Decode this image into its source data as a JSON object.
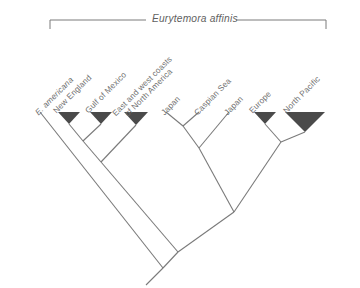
{
  "figure": {
    "type": "cladogram",
    "background_color": "#ffffff",
    "line_color": "#7a7a7a",
    "triangle_fill": "#4a4a4a",
    "text_color": "#6f6f6f",
    "clade_bracket": {
      "label": "Eurytemora affinis",
      "style": "italic",
      "left_x": 50,
      "right_x": 326,
      "bar_y": 20,
      "tick_height": 9,
      "label_x": 152,
      "label_y": 13
    },
    "tips": [
      {
        "id": "e-americana",
        "label": "E. americana",
        "italic": true,
        "two_line": false,
        "collapsed": false,
        "x": 40,
        "y": 112,
        "label_x": 40,
        "label_y": 108
      },
      {
        "id": "new-england",
        "label": "New England",
        "italic": false,
        "two_line": false,
        "collapsed": true,
        "triangle_half_width": 11,
        "triangle_height": 12,
        "x": 69,
        "y": 112,
        "label_x": 58,
        "label_y": 106
      },
      {
        "id": "gulf-of-mexico",
        "label": "Gulf of Mexico",
        "italic": false,
        "two_line": false,
        "collapsed": true,
        "triangle_half_width": 11,
        "triangle_height": 12,
        "x": 101,
        "y": 112,
        "label_x": 90,
        "label_y": 106
      },
      {
        "id": "east-and-west-coasts",
        "label": "East and west coasts\nof North America",
        "italic": false,
        "two_line": true,
        "collapsed": true,
        "triangle_half_width": 12,
        "triangle_height": 13,
        "x": 136,
        "y": 112,
        "label_x": 124,
        "label_y": 106
      },
      {
        "id": "japan-1",
        "label": "Japan",
        "italic": false,
        "two_line": false,
        "collapsed": false,
        "x": 166,
        "y": 112,
        "label_x": 166,
        "label_y": 108
      },
      {
        "id": "caspian-sea",
        "label": "Caspian Sea",
        "italic": false,
        "two_line": false,
        "collapsed": false,
        "x": 199,
        "y": 112,
        "label_x": 199,
        "label_y": 108
      },
      {
        "id": "japan-2",
        "label": "Japan",
        "italic": false,
        "two_line": false,
        "collapsed": false,
        "x": 229,
        "y": 112,
        "label_x": 229,
        "label_y": 108
      },
      {
        "id": "europe",
        "label": "Europe",
        "italic": false,
        "two_line": false,
        "collapsed": true,
        "triangle_half_width": 11,
        "triangle_height": 12,
        "x": 265,
        "y": 112,
        "label_x": 254,
        "label_y": 106
      },
      {
        "id": "north-pacific",
        "label": "North Pacific",
        "italic": false,
        "two_line": false,
        "collapsed": true,
        "triangle_half_width": 20,
        "triangle_height": 20,
        "x": 305,
        "y": 112,
        "label_x": 288,
        "label_y": 106
      }
    ],
    "nodes": [
      {
        "id": "node-ne-gom",
        "x": 83,
        "y": 141
      },
      {
        "id": "node-north-america",
        "x": 101,
        "y": 162
      },
      {
        "id": "node-japan-caspian",
        "x": 183,
        "y": 126
      },
      {
        "id": "node-japan-clade",
        "x": 199,
        "y": 148
      },
      {
        "id": "node-europe-npacific",
        "x": 281,
        "y": 142
      },
      {
        "id": "node-right-clade",
        "x": 234,
        "y": 212
      },
      {
        "id": "node-affinis",
        "x": 178,
        "y": 252
      },
      {
        "id": "node-root",
        "x": 163,
        "y": 268
      }
    ],
    "edges": [
      {
        "from_x": 40,
        "from_y": 112,
        "to_x": 163,
        "to_y": 268,
        "name": "branch-e-americana"
      },
      {
        "from_x": 69,
        "from_y": 124,
        "to_x": 83,
        "to_y": 141,
        "name": "branch-new-england"
      },
      {
        "from_x": 101,
        "from_y": 124,
        "to_x": 83,
        "to_y": 141,
        "name": "branch-gulf-of-mexico"
      },
      {
        "from_x": 83,
        "from_y": 141,
        "to_x": 101,
        "to_y": 162,
        "name": "branch-ne-gom-stem"
      },
      {
        "from_x": 136,
        "from_y": 125,
        "to_x": 101,
        "to_y": 162,
        "name": "branch-east-west-coasts"
      },
      {
        "from_x": 101,
        "from_y": 162,
        "to_x": 178,
        "to_y": 252,
        "name": "branch-north-america-stem"
      },
      {
        "from_x": 166,
        "from_y": 112,
        "to_x": 183,
        "to_y": 126,
        "name": "branch-japan-1"
      },
      {
        "from_x": 199,
        "from_y": 112,
        "to_x": 183,
        "to_y": 126,
        "name": "branch-caspian-sea"
      },
      {
        "from_x": 183,
        "from_y": 126,
        "to_x": 199,
        "to_y": 148,
        "name": "branch-japan-caspian-stem"
      },
      {
        "from_x": 229,
        "from_y": 112,
        "to_x": 199,
        "to_y": 148,
        "name": "branch-japan-2"
      },
      {
        "from_x": 199,
        "from_y": 148,
        "to_x": 234,
        "to_y": 212,
        "name": "branch-japan-clade-stem"
      },
      {
        "from_x": 265,
        "from_y": 124,
        "to_x": 281,
        "to_y": 142,
        "name": "branch-europe"
      },
      {
        "from_x": 305,
        "from_y": 132,
        "to_x": 281,
        "to_y": 142,
        "name": "branch-north-pacific"
      },
      {
        "from_x": 281,
        "from_y": 142,
        "to_x": 234,
        "to_y": 212,
        "name": "branch-europe-npacific-stem"
      },
      {
        "from_x": 234,
        "from_y": 212,
        "to_x": 178,
        "to_y": 252,
        "name": "branch-right-clade-stem"
      },
      {
        "from_x": 178,
        "from_y": 252,
        "to_x": 163,
        "to_y": 268,
        "name": "branch-affinis-stem"
      },
      {
        "from_x": 163,
        "from_y": 268,
        "to_x": 146,
        "to_y": 285,
        "name": "branch-root"
      }
    ]
  }
}
